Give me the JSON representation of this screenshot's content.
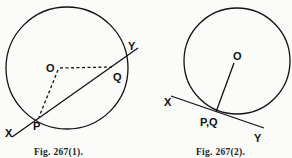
{
  "figures": [
    {
      "caption": "Fig. 267(1).",
      "labels": {
        "center": "O",
        "point_p": "P",
        "point_q": "Q",
        "line_start": "X",
        "line_end": "Y"
      },
      "description": "Secant line XY cuts circle at P and Q; dashed radii OP and OQ"
    },
    {
      "caption": "Fig. 267(2).",
      "labels": {
        "center": "O",
        "point_pq": "P,Q",
        "line_start": "X",
        "line_end": "Y"
      },
      "description": "Tangent line XY touches circle at coincident points P,Q; solid radius O to P,Q"
    }
  ],
  "colors": {
    "ink": "#111111",
    "background": "#fbfbf9"
  }
}
